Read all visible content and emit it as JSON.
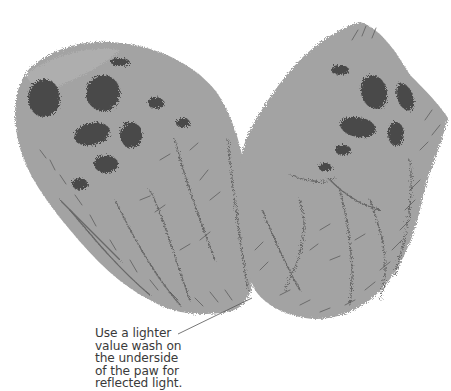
{
  "illustration": {
    "subject": "two paw illustrations (painted fur with dark pads)",
    "colors": {
      "base": "#a3a3a3",
      "light": "#b4b4b4",
      "pad": "#4a4a4a",
      "stroke": "#5e5e5e",
      "background": "#ffffff",
      "leader_line": "#555555"
    }
  },
  "caption": {
    "lines": [
      "Use a lighter",
      "value wash on",
      "the underside",
      "of the paw for",
      "reflected light."
    ]
  }
}
